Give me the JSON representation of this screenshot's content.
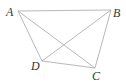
{
  "diagram": {
    "type": "geometry-figure",
    "points": {
      "A": {
        "label": "A",
        "x": 18,
        "y": 11,
        "lx": 6,
        "ly": 16
      },
      "B": {
        "label": "B",
        "x": 111,
        "y": 10,
        "lx": 113,
        "ly": 17
      },
      "C": {
        "label": "C",
        "x": 95,
        "y": 68,
        "lx": 92,
        "ly": 80
      },
      "D": {
        "label": "D",
        "x": 42,
        "y": 61,
        "lx": 31,
        "ly": 70
      }
    },
    "segments": [
      [
        "A",
        "B"
      ],
      [
        "A",
        "D"
      ],
      [
        "A",
        "C"
      ],
      [
        "B",
        "D"
      ],
      [
        "B",
        "C"
      ],
      [
        "D",
        "C"
      ]
    ],
    "colors": {
      "line": "#b8b8b8",
      "label": "#333333"
    }
  }
}
